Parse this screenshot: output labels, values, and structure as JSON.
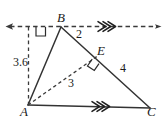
{
  "figure": {
    "kind": "geometry-diagram",
    "stroke_color": "#333333",
    "dash_color": "#444444",
    "background": "#ffffff",
    "points": [
      {
        "id": "A",
        "label": "A",
        "x": 28,
        "y": 105
      },
      {
        "id": "B",
        "label": "B",
        "x": 61,
        "y": 27
      },
      {
        "id": "C",
        "label": "C",
        "x": 150,
        "y": 108
      },
      {
        "id": "E",
        "label": "E",
        "x": 99,
        "y": 55
      }
    ],
    "segment_labels": {
      "be": "2",
      "ec": "4",
      "ae": "3",
      "altitude": "3.6"
    },
    "right_angles": [
      {
        "at": "B",
        "between": "vertical-dashed-and-horizontal-dashed"
      },
      {
        "at": "E",
        "between": "AE-and-BC"
      }
    ],
    "parallel_marks": [
      {
        "on": "horizontal-dashed-line-through-B",
        "chevrons": 2
      },
      {
        "on": "AC",
        "chevrons": 2
      }
    ]
  }
}
